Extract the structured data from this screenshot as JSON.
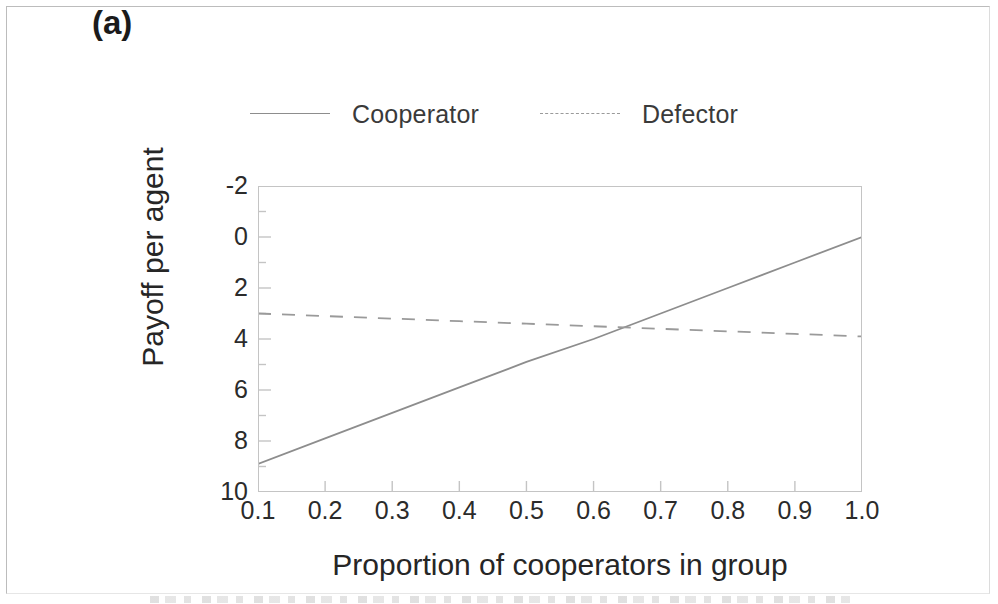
{
  "figure": {
    "panel_label": "(a)"
  },
  "legend": {
    "position": "top",
    "entries": [
      {
        "label": "Cooperator",
        "style": "solid",
        "color": "#8d8d8d"
      },
      {
        "label": "Defector",
        "style": "dashed",
        "color": "#9a9a9a"
      }
    ]
  },
  "axes": {
    "xlabel": "Proportion of cooperators in group",
    "ylabel": "Payoff per agent",
    "xticks": [
      "0.1",
      "0.2",
      "0.3",
      "0.4",
      "0.5",
      "0.6",
      "0.7",
      "0.8",
      "0.9",
      "1.0"
    ],
    "yticks": [
      "10",
      "8",
      "6",
      "4",
      "2",
      "0",
      "-2"
    ]
  },
  "chart_data": {
    "type": "line",
    "title": "(a)",
    "xlabel": "Proportion of cooperators in group",
    "ylabel": "Payoff per agent",
    "xlim": [
      0.1,
      1.0
    ],
    "ylim": [
      -2,
      10
    ],
    "xticks": [
      0.1,
      0.2,
      0.3,
      0.4,
      0.5,
      0.6,
      0.7,
      0.8,
      0.9,
      1.0
    ],
    "yticks": [
      -2,
      0,
      2,
      4,
      6,
      8,
      10
    ],
    "y_minor_ticks": [
      -1,
      1,
      3,
      5,
      7,
      9
    ],
    "grid": false,
    "legend_position": "top",
    "x": [
      0.1,
      0.2,
      0.3,
      0.4,
      0.5,
      0.6,
      0.7,
      0.8,
      0.9,
      1.0
    ],
    "series": [
      {
        "name": "Cooperator",
        "style": "solid",
        "color": "#8d8d8d",
        "values": [
          -0.9,
          0.1,
          1.1,
          2.1,
          3.1,
          4.0,
          5.0,
          6.0,
          7.0,
          8.0
        ]
      },
      {
        "name": "Defector",
        "style": "dashed",
        "color": "#9a9a9a",
        "values": [
          5.0,
          4.9,
          4.8,
          4.7,
          4.6,
          4.5,
          4.4,
          4.3,
          4.2,
          4.1
        ]
      }
    ],
    "annotations": [
      {
        "type": "crossing",
        "x": 0.635,
        "y": 4.42,
        "note": "Cooperator payoff overtakes Defector payoff"
      }
    ]
  }
}
